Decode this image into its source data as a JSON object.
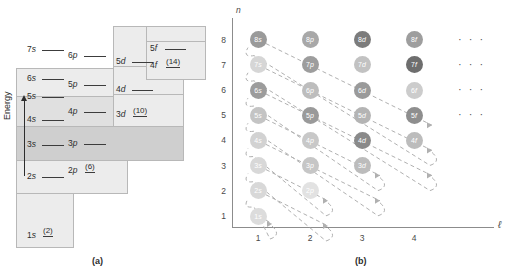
{
  "figure": {
    "panel_a_caption": "(a)",
    "panel_b_caption": "(b)"
  },
  "panel_a": {
    "axis_label": "Energy",
    "axis_icon": "up-arrow-icon",
    "levels": [
      {
        "id": "1s",
        "n": 1,
        "l": 0,
        "orbital": "1",
        "sub": "s",
        "capacity": "(2)"
      },
      {
        "id": "2s",
        "n": 2,
        "l": 0,
        "orbital": "2",
        "sub": "s",
        "capacity": ""
      },
      {
        "id": "2p",
        "n": 2,
        "l": 1,
        "orbital": "2",
        "sub": "p",
        "capacity": "(6)"
      },
      {
        "id": "3s",
        "n": 3,
        "l": 0,
        "orbital": "3",
        "sub": "s",
        "capacity": ""
      },
      {
        "id": "3p",
        "n": 3,
        "l": 1,
        "orbital": "3",
        "sub": "p",
        "capacity": ""
      },
      {
        "id": "3d",
        "n": 3,
        "l": 2,
        "orbital": "3",
        "sub": "d",
        "capacity": "(10)"
      },
      {
        "id": "4s",
        "n": 4,
        "l": 0,
        "orbital": "4",
        "sub": "s",
        "capacity": ""
      },
      {
        "id": "4p",
        "n": 4,
        "l": 1,
        "orbital": "4",
        "sub": "p",
        "capacity": ""
      },
      {
        "id": "4d",
        "n": 4,
        "l": 2,
        "orbital": "4",
        "sub": "d",
        "capacity": ""
      },
      {
        "id": "4f",
        "n": 4,
        "l": 3,
        "orbital": "4",
        "sub": "f",
        "capacity": "(14)"
      },
      {
        "id": "5s",
        "n": 5,
        "l": 0,
        "orbital": "5",
        "sub": "s",
        "capacity": ""
      },
      {
        "id": "5p",
        "n": 5,
        "l": 1,
        "orbital": "5",
        "sub": "p",
        "capacity": ""
      },
      {
        "id": "5d",
        "n": 5,
        "l": 2,
        "orbital": "5",
        "sub": "d",
        "capacity": ""
      },
      {
        "id": "5f",
        "n": 5,
        "l": 3,
        "orbital": "5",
        "sub": "f",
        "capacity": ""
      },
      {
        "id": "6s",
        "n": 6,
        "l": 0,
        "orbital": "6",
        "sub": "s",
        "capacity": ""
      },
      {
        "id": "6p",
        "n": 6,
        "l": 1,
        "orbital": "6",
        "sub": "p",
        "capacity": ""
      },
      {
        "id": "7s",
        "n": 7,
        "l": 0,
        "orbital": "7",
        "sub": "s",
        "capacity": ""
      }
    ]
  },
  "panel_b": {
    "y_axis_label": "n",
    "x_axis_label": "ℓ",
    "y_ticks": [
      "8",
      "7",
      "6",
      "5",
      "4",
      "3",
      "2",
      "1"
    ],
    "x_ticks": [
      "1",
      "2",
      "3",
      "4"
    ],
    "ellipsis": "· · ·",
    "ellipsis_rows": [
      8,
      7,
      6,
      5
    ],
    "orbitals": [
      {
        "n": 8,
        "col": 1,
        "num": "8",
        "sub": "s",
        "shade": "#9a9a9a"
      },
      {
        "n": 8,
        "col": 2,
        "num": "8",
        "sub": "p",
        "shade": "#a8a8a8"
      },
      {
        "n": 8,
        "col": 3,
        "num": "8",
        "sub": "d",
        "shade": "#7c7c7c"
      },
      {
        "n": 8,
        "col": 4,
        "num": "8",
        "sub": "f",
        "shade": "#9e9e9e"
      },
      {
        "n": 7,
        "col": 1,
        "num": "7",
        "sub": "s",
        "shade": "#d6d6d6"
      },
      {
        "n": 7,
        "col": 2,
        "num": "7",
        "sub": "p",
        "shade": "#9d9d9d"
      },
      {
        "n": 7,
        "col": 3,
        "num": "7",
        "sub": "d",
        "shade": "#c2c2c2"
      },
      {
        "n": 7,
        "col": 4,
        "num": "7",
        "sub": "f",
        "shade": "#6e6e6e"
      },
      {
        "n": 6,
        "col": 1,
        "num": "6",
        "sub": "s",
        "shade": "#9c9c9c"
      },
      {
        "n": 6,
        "col": 2,
        "num": "6",
        "sub": "p",
        "shade": "#bdbdbd"
      },
      {
        "n": 6,
        "col": 3,
        "num": "6",
        "sub": "d",
        "shade": "#9a9a9a"
      },
      {
        "n": 6,
        "col": 4,
        "num": "6",
        "sub": "f",
        "shade": "#cccccc"
      },
      {
        "n": 5,
        "col": 1,
        "num": "5",
        "sub": "s",
        "shade": "#c4c4c4"
      },
      {
        "n": 5,
        "col": 2,
        "num": "5",
        "sub": "p",
        "shade": "#9a9a9a"
      },
      {
        "n": 5,
        "col": 3,
        "num": "5",
        "sub": "d",
        "shade": "#b4b4b4"
      },
      {
        "n": 5,
        "col": 4,
        "num": "5",
        "sub": "f",
        "shade": "#8e8e8e"
      },
      {
        "n": 4,
        "col": 1,
        "num": "4",
        "sub": "s",
        "shade": "#d2d2d2"
      },
      {
        "n": 4,
        "col": 2,
        "num": "4",
        "sub": "p",
        "shade": "#c8c8c8"
      },
      {
        "n": 4,
        "col": 3,
        "num": "4",
        "sub": "d",
        "shade": "#8a8a8a"
      },
      {
        "n": 4,
        "col": 4,
        "num": "4",
        "sub": "f",
        "shade": "#bcbcbc"
      },
      {
        "n": 3,
        "col": 1,
        "num": "3",
        "sub": "s",
        "shade": "#d8d8d8"
      },
      {
        "n": 3,
        "col": 2,
        "num": "3",
        "sub": "p",
        "shade": "#c6c6c6"
      },
      {
        "n": 3,
        "col": 3,
        "num": "3",
        "sub": "d",
        "shade": "#bcbcbc"
      },
      {
        "n": 2,
        "col": 1,
        "num": "2",
        "sub": "s",
        "shade": "#d8d8d8"
      },
      {
        "n": 2,
        "col": 2,
        "num": "2",
        "sub": "p",
        "shade": "#e2e2e2"
      },
      {
        "n": 1,
        "col": 1,
        "num": "1",
        "sub": "s",
        "shade": "#dcdcdc"
      }
    ],
    "diagonal_arrows": [
      {
        "start_n": 1,
        "start_col": 1,
        "length": 1
      },
      {
        "start_n": 2,
        "start_col": 1,
        "length": 2
      },
      {
        "start_n": 3,
        "start_col": 1,
        "length": 2
      },
      {
        "start_n": 4,
        "start_col": 1,
        "length": 3
      },
      {
        "start_n": 5,
        "start_col": 1,
        "length": 3
      },
      {
        "start_n": 6,
        "start_col": 1,
        "length": 4
      },
      {
        "start_n": 7,
        "start_col": 1,
        "length": 4
      },
      {
        "start_n": 8,
        "start_col": 1,
        "length": 4
      }
    ]
  },
  "colors": {
    "box_fill_light": "#ececec",
    "box_fill_mid": "#e0e0e0",
    "box_fill_dark": "#cfcfcf",
    "box_border": "#b8b8b8",
    "axis": "#8c8c8c",
    "text": "#2d2d2d",
    "arrow": "#b0b0b0"
  }
}
